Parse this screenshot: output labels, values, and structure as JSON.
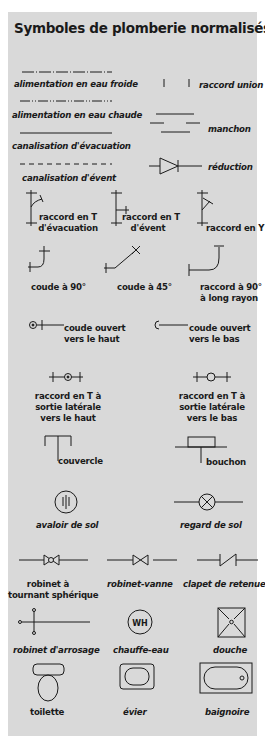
{
  "title": "Symboles de plomberie normalisés",
  "colors": {
    "panel": "#d9d9d9",
    "ink": "#1a1a1a",
    "background": "#ffffff"
  },
  "symbols": [
    {
      "label": "alimentation en eau froide",
      "icon": "dash-dot-line"
    },
    {
      "label": "raccord union",
      "icon": "union-ticks"
    },
    {
      "label": "alimentation en eau chaude",
      "icon": "dash-dot-dot-line"
    },
    {
      "label": "manchon",
      "icon": "coupling-lines"
    },
    {
      "label": "canalisation d'évacuation",
      "icon": "solid-line"
    },
    {
      "label": "canalisation d'évent",
      "icon": "dashed-line"
    },
    {
      "label": "réduction",
      "icon": "reducer-triangle"
    },
    {
      "label_lines": [
        "raccord en T",
        "d'évacuation"
      ],
      "icon": "drain-tee"
    },
    {
      "label_lines": [
        "raccord en T",
        "d'évent"
      ],
      "icon": "vent-tee"
    },
    {
      "label": "raccord en Y",
      "icon": "wye"
    },
    {
      "label": "coude à 90°",
      "icon": "elbow-90"
    },
    {
      "label": "coude à 45°",
      "icon": "elbow-45"
    },
    {
      "label_lines": [
        "raccord à 90°",
        "à long rayon"
      ],
      "icon": "long-sweep-90"
    },
    {
      "label_lines": [
        "coude ouvert",
        "vers le haut"
      ],
      "icon": "elbow-up"
    },
    {
      "label_lines": [
        "coude ouvert",
        "vers le bas"
      ],
      "icon": "elbow-down"
    },
    {
      "label_lines": [
        "raccord en T à",
        "sortie latérale",
        "vers le haut"
      ],
      "icon": "tee-outlet-up"
    },
    {
      "label_lines": [
        "raccord en T à",
        "sortie latérale",
        "vers le bas"
      ],
      "icon": "tee-outlet-down"
    },
    {
      "label": "couvercle",
      "icon": "cap"
    },
    {
      "label": "bouchon",
      "icon": "plug"
    },
    {
      "label": "avaloir de sol",
      "icon": "floor-drain"
    },
    {
      "label": "regard de sol",
      "icon": "cleanout"
    },
    {
      "label_lines": [
        "robinet à",
        "tournant sphérique"
      ],
      "icon": "ball-valve"
    },
    {
      "label": "robinet-vanne",
      "icon": "gate-valve"
    },
    {
      "label": "clapet de retenue",
      "icon": "check-valve"
    },
    {
      "label": "robinet d'arrosage",
      "icon": "hose-bibb"
    },
    {
      "label": "chauffe-eau",
      "icon": "water-heater",
      "icon_text": "WH"
    },
    {
      "label": "douche",
      "icon": "shower"
    },
    {
      "label": "toilette",
      "icon": "toilet"
    },
    {
      "label": "évier",
      "icon": "sink"
    },
    {
      "label": "baignoire",
      "icon": "bathtub"
    }
  ]
}
